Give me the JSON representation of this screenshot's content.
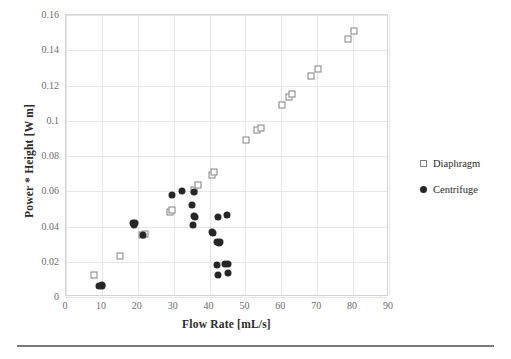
{
  "chart_data": {
    "type": "scatter",
    "title": "",
    "xlabel": "Flow Rate [mL/s]",
    "ylabel": "Power * Height [W m]",
    "xlim": [
      0,
      90
    ],
    "ylim": [
      0,
      0.16
    ],
    "xticks": [
      "0",
      "10",
      "20",
      "30",
      "40",
      "50",
      "60",
      "70",
      "80",
      "90"
    ],
    "xtick_values": [
      0,
      10,
      20,
      30,
      40,
      50,
      60,
      70,
      80,
      90
    ],
    "yticks": [
      "0",
      "0.02",
      "0.04",
      "0.06",
      "0.08",
      "0.1",
      "0.12",
      "0.14",
      "0.16"
    ],
    "ytick_values": [
      0,
      0.02,
      0.04,
      0.06,
      0.08,
      0.1,
      0.12,
      0.14,
      0.16
    ],
    "grid": true,
    "legend_position": "right",
    "series": [
      {
        "name": "Diaphragm",
        "marker": "open-square",
        "color": "#808080",
        "points": [
          [
            7.8,
            0.0122
          ],
          [
            15.0,
            0.0232
          ],
          [
            21.3,
            0.0352
          ],
          [
            21.9,
            0.0355
          ],
          [
            28.9,
            0.0483
          ],
          [
            29.5,
            0.0492
          ],
          [
            35.8,
            0.0605
          ],
          [
            36.9,
            0.0638
          ],
          [
            40.6,
            0.069
          ],
          [
            41.3,
            0.0712
          ],
          [
            50.2,
            0.0888
          ],
          [
            53.3,
            0.095
          ],
          [
            54.2,
            0.096
          ],
          [
            60.2,
            0.1092
          ],
          [
            62.1,
            0.1132
          ],
          [
            63.0,
            0.115
          ],
          [
            68.3,
            0.1252
          ],
          [
            70.2,
            0.1292
          ],
          [
            78.6,
            0.1462
          ],
          [
            80.3,
            0.1508
          ]
        ]
      },
      {
        "name": "Centrifuge",
        "marker": "filled-circle",
        "color": "#262626",
        "points": [
          [
            9.3,
            0.0063
          ],
          [
            9.9,
            0.0062
          ],
          [
            10.1,
            0.0068
          ],
          [
            18.7,
            0.0418
          ],
          [
            19.0,
            0.0408
          ],
          [
            19.3,
            0.0422
          ],
          [
            21.5,
            0.0352
          ],
          [
            29.4,
            0.0578
          ],
          [
            32.3,
            0.0604
          ],
          [
            35.6,
            0.0596
          ],
          [
            35.1,
            0.0522
          ],
          [
            35.6,
            0.0458
          ],
          [
            36.0,
            0.0452
          ],
          [
            35.3,
            0.0406
          ],
          [
            40.8,
            0.0368
          ],
          [
            41.0,
            0.0362
          ],
          [
            42.3,
            0.0452
          ],
          [
            44.8,
            0.0464
          ],
          [
            42.0,
            0.031
          ],
          [
            42.6,
            0.0308
          ],
          [
            43.0,
            0.0312
          ],
          [
            42.0,
            0.0184
          ],
          [
            44.4,
            0.0188
          ],
          [
            45.2,
            0.019
          ],
          [
            42.3,
            0.0126
          ],
          [
            45.0,
            0.0136
          ]
        ]
      }
    ]
  },
  "legend": {
    "entries": [
      {
        "label": "Diaphragm",
        "marker": "open-square"
      },
      {
        "label": "Centrifuge",
        "marker": "filled-circle"
      }
    ]
  },
  "colors": {
    "diaphragm": "#808080",
    "centrifuge": "#262626",
    "grid": "#e6e6e6",
    "axis_text": "#6b6b6b",
    "title_text": "#2b2b2b"
  }
}
